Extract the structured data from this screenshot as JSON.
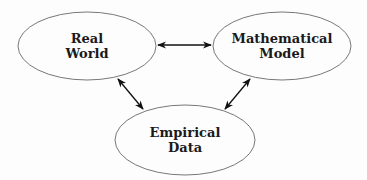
{
  "diagram": {
    "nodes": [
      {
        "id": "real-world",
        "lines": [
          "Real",
          "World"
        ],
        "cx": 87,
        "cy": 46,
        "rx": 69,
        "ry": 34
      },
      {
        "id": "mathematical-model",
        "lines": [
          "Mathematical",
          "Model"
        ],
        "cx": 282,
        "cy": 46,
        "rx": 69,
        "ry": 34
      },
      {
        "id": "empirical-data",
        "lines": [
          "Empirical",
          "Data"
        ],
        "cx": 185,
        "cy": 140,
        "rx": 70,
        "ry": 35
      }
    ],
    "edges": [
      {
        "from": "real-world",
        "to": "mathematical-model",
        "direction": "bidirectional"
      },
      {
        "from": "real-world",
        "to": "empirical-data",
        "direction": "bidirectional"
      },
      {
        "from": "mathematical-model",
        "to": "empirical-data",
        "direction": "bidirectional"
      }
    ],
    "colors": {
      "stroke": "#555555",
      "arrow": "#111111",
      "text": "#1a1a1a"
    }
  }
}
